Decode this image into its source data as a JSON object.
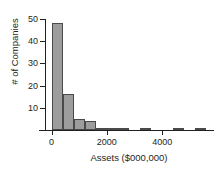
{
  "chart_data": {
    "type": "bar",
    "title": "",
    "subtitle": "",
    "xlabel": "Assets ($000,000)",
    "ylabel": "# of Companies",
    "xlim": [
      -200,
      5800
    ],
    "ylim": [
      0,
      50
    ],
    "grid": false,
    "legend": null,
    "bin_width": 400,
    "bar_color": "#9d9d9d",
    "bar_edge_color": "#4a4a4a",
    "axis_color": "#231f20",
    "xticks": [
      0,
      2000,
      4000
    ],
    "xtick_labels": [
      "0",
      "2000",
      "4000"
    ],
    "yticks": [
      10,
      20,
      30,
      40,
      50
    ],
    "ytick_labels": [
      "10",
      "20",
      "30",
      "40",
      "50"
    ],
    "bins": [
      {
        "left": 0,
        "right": 400,
        "value": 48
      },
      {
        "left": 400,
        "right": 800,
        "value": 16
      },
      {
        "left": 800,
        "right": 1200,
        "value": 5
      },
      {
        "left": 1200,
        "right": 1600,
        "value": 4
      },
      {
        "left": 1600,
        "right": 2000,
        "value": 1
      },
      {
        "left": 2000,
        "right": 2400,
        "value": 1
      },
      {
        "left": 2400,
        "right": 2800,
        "value": 1
      },
      {
        "left": 3200,
        "right": 3600,
        "value": 1
      },
      {
        "left": 4400,
        "right": 4800,
        "value": 1
      },
      {
        "left": 5200,
        "right": 5600,
        "value": 1
      }
    ],
    "categories": [
      "0-400",
      "400-800",
      "800-1200",
      "1200-1600",
      "1600-2000",
      "2000-2400",
      "2400-2800",
      "3200-3600",
      "4400-4800",
      "5200-5600"
    ],
    "values": [
      48,
      16,
      5,
      4,
      1,
      1,
      1,
      1,
      1,
      1
    ]
  }
}
